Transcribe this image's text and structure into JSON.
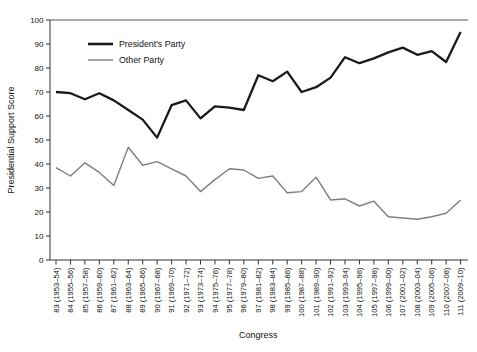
{
  "chart_data": {
    "type": "line",
    "title": "",
    "xlabel": "Congress",
    "ylabel": "Presidential Support Score",
    "ylim": [
      0,
      100
    ],
    "yticks": [
      0,
      10,
      20,
      30,
      40,
      50,
      60,
      70,
      80,
      90,
      100
    ],
    "grid": false,
    "legend_position": "upper-left-inside",
    "categories": [
      "83 (1953–54)",
      "84 (1955–56)",
      "85 (1957–58)",
      "86 (1959–60)",
      "87 (1961–62)",
      "88 (1963–64)",
      "89 (1965–66)",
      "90 (1967–68)",
      "91 (1969–70)",
      "92 (1971–72)",
      "93 (1973–74)",
      "94 (1975–76)",
      "95 (1977–78)",
      "96 (1979–80)",
      "97 (1981–82)",
      "98 (1983–84)",
      "99 (1985–86)",
      "100 (1987–88)",
      "101 (1989–90)",
      "102 (1991–92)",
      "103 (1993–94)",
      "104 (1995–96)",
      "105 (1997–98)",
      "106 (1999–00)",
      "107 (2001–02)",
      "108 (2003–04)",
      "109 (2005–06)",
      "110 (2007–08)",
      "111 (2009–10)"
    ],
    "series": [
      {
        "name": "President's Party",
        "color": "#1a1a1a",
        "line_width": 2.3,
        "values": [
          70,
          69.5,
          67,
          69.5,
          66.5,
          62.5,
          58.5,
          51,
          64.5,
          66.5,
          59,
          64,
          63.5,
          62.5,
          77,
          74.5,
          78.5,
          70,
          72,
          76,
          84.5,
          82,
          84,
          86.5,
          88.5,
          85.5,
          87,
          82.5,
          95
        ]
      },
      {
        "name": "Other Party",
        "color": "#7f7f7f",
        "line_width": 1.4,
        "values": [
          38.5,
          35,
          40.5,
          36.5,
          31,
          47,
          39.5,
          41,
          38,
          35,
          28.5,
          33.5,
          38,
          37.5,
          34,
          35,
          28,
          28.5,
          34.5,
          25,
          25.5,
          22.5,
          24.5,
          18,
          17.5,
          17,
          18,
          19.5,
          25
        ]
      }
    ]
  }
}
